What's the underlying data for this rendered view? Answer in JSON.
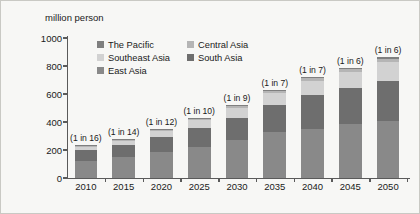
{
  "chart_data": {
    "type": "bar",
    "stacked": true,
    "title": "",
    "subtitle": "",
    "xlabel": "",
    "ylabel": "million person",
    "unit_caption": "million person",
    "ylim": [
      0,
      1000
    ],
    "ytick_values": [
      0,
      200,
      400,
      600,
      800,
      1000
    ],
    "ytick_labels": [
      "0",
      "200",
      "400",
      "600",
      "800",
      "1000"
    ],
    "grid": false,
    "legend_position": "top-left-inside",
    "categories": [
      "2010",
      "2015",
      "2020",
      "2025",
      "2030",
      "2035",
      "2040",
      "2045",
      "2050"
    ],
    "series": [
      {
        "name": "East Asia",
        "color": "#898989",
        "values": [
          125,
          150,
          185,
          225,
          270,
          330,
          350,
          385,
          405
        ]
      },
      {
        "name": "South Asia",
        "color": "#6e6e6e",
        "values": [
          75,
          85,
          110,
          135,
          160,
          190,
          245,
          260,
          290
        ]
      },
      {
        "name": "Southeast Asia",
        "color": "#d2d2d2",
        "values": [
          25,
          32,
          42,
          55,
          70,
          85,
          100,
          115,
          135
        ]
      },
      {
        "name": "Central Asia",
        "color": "#b5b5b5",
        "values": [
          6,
          7,
          8,
          10,
          12,
          14,
          16,
          18,
          20
        ]
      },
      {
        "name": "The Pacific",
        "color": "#7f7f7f",
        "values": [
          4,
          5,
          6,
          7,
          8,
          9,
          10,
          11,
          12
        ]
      }
    ],
    "totals": [
      235,
      279,
      351,
      432,
      520,
      628,
      721,
      789,
      862
    ],
    "annotations": [
      "(1 in 16)",
      "(1 in 14)",
      "(1 in 12)",
      "(1 in 10)",
      "(1 in 9)",
      "(1 in 7)",
      "(1 in 7)",
      "(1 in 6)",
      "(1 in 6)"
    ],
    "legend_entries": [
      {
        "label": "The Pacific",
        "color": "#7f7f7f"
      },
      {
        "label": "Central Asia",
        "color": "#b5b5b5"
      },
      {
        "label": "Southeast Asia",
        "color": "#d2d2d2"
      },
      {
        "label": "South Asia",
        "color": "#6e6e6e"
      },
      {
        "label": "East Asia",
        "color": "#898989"
      }
    ],
    "axis_color": "#5a5a5a",
    "background_color": "#f7f7f5"
  }
}
